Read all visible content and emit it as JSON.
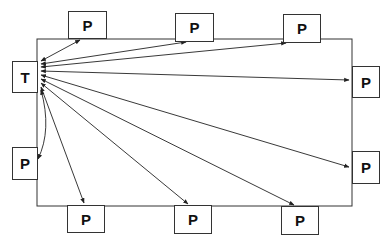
{
  "diagram": {
    "teacher": {
      "label": "T"
    },
    "participants": [
      {
        "label": "P",
        "side": "top"
      },
      {
        "label": "P",
        "side": "top"
      },
      {
        "label": "P",
        "side": "top"
      },
      {
        "label": "P",
        "side": "right"
      },
      {
        "label": "P",
        "side": "right"
      },
      {
        "label": "P",
        "side": "bottom"
      },
      {
        "label": "P",
        "side": "bottom"
      },
      {
        "label": "P",
        "side": "bottom"
      },
      {
        "label": "P",
        "side": "left"
      }
    ],
    "connections": "bidirectional arrows from T to each P"
  }
}
